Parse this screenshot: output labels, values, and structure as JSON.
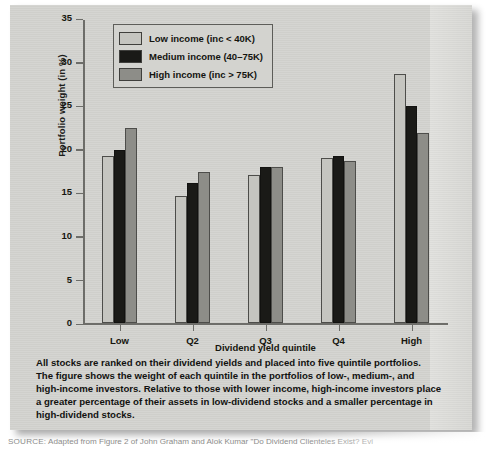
{
  "chart_data": {
    "type": "bar",
    "title": "",
    "xlabel": "Dividend yield quintile",
    "ylabel": "Portfolio weight (in %)",
    "categories": [
      "Low",
      "Q2",
      "Q3",
      "Q4",
      "High"
    ],
    "ylim": [
      0,
      35
    ],
    "yticks": [
      0,
      5,
      10,
      15,
      20,
      25,
      30,
      35
    ],
    "grid": false,
    "legend_position": "top-left-inside",
    "series": [
      {
        "name": "Low income (inc < 40K)",
        "color": "#c5c5c0",
        "values": [
          19.2,
          14.6,
          17.0,
          19.0,
          28.6
        ]
      },
      {
        "name": "Medium income (40–75K)",
        "color": "#1a1a17",
        "values": [
          19.9,
          16.1,
          18.0,
          19.2,
          25.0
        ]
      },
      {
        "name": "High income (inc > 75K)",
        "color": "#8d8d88",
        "values": [
          22.4,
          17.4,
          18.0,
          18.6,
          21.8
        ]
      }
    ]
  },
  "legend": {
    "items": [
      {
        "label": "Low income (inc < 40K)",
        "color": "#c5c5c0"
      },
      {
        "label": "Medium income (40–75K)",
        "color": "#1a1a17"
      },
      {
        "label": "High income (inc > 75K)",
        "color": "#8d8d88"
      }
    ]
  },
  "caption": {
    "lines": [
      "All stocks are ranked on their dividend yields and placed into five quintile portfolios.",
      "The figure shows the weight of each quintile in the portfolios of low-, medium-, and",
      "high-income investors. Relative to those with lower income, high-income investors place",
      "a greater percentage of their assets in low-dividend stocks and a smaller percentage in",
      "high-dividend stocks."
    ]
  },
  "source": {
    "prefix": "SOURCE:",
    "text": "Adapted from Figure 2 of John Graham and Alok Kumar \"Do Dividend Clienteles Exist? Evi"
  },
  "colors": {
    "panel_background": "#d3d3cf",
    "axis": "#6d6d69",
    "text": "#121210"
  }
}
